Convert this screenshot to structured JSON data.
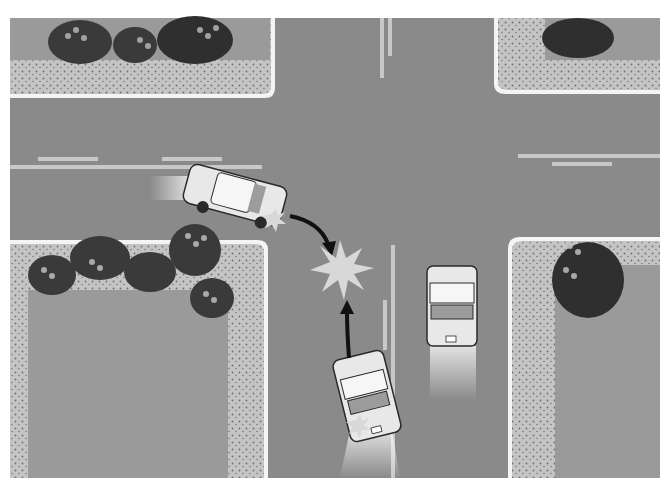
{
  "figure": {
    "alt": "Illustration of an intersection collision: a car turning left from the west road strikes a car heading north that is also turning, while a third car waits in the northbound lane.",
    "colors": {
      "background": "#ffffff",
      "road": "#8a8a8a",
      "lane_marking": "#c8c8c8",
      "curb": "#f4f4f4",
      "sidewalk": "#c4c4c4",
      "sidewalk_dots": "#6e6e6e",
      "grass": "#9a9a9a",
      "shrub_dark": "#3a3a3a",
      "shrub_mid": "#5a5a5a",
      "shrub_light": "#bdbdbd",
      "car_body": "#e8e8e8",
      "car_outline": "#2a2a2a",
      "car_glass": "#9c9c9c",
      "impact_star": "#d8d8d8",
      "arrow": "#111111"
    },
    "elements": {
      "car_west": "car turning from west road",
      "car_south": "car moving north, turning left",
      "car_parked": "car in northbound lane",
      "impact": "collision point",
      "path_arrow_west": "curved path arrow from west car to impact",
      "path_arrow_south": "path arrow from south car to impact"
    }
  }
}
